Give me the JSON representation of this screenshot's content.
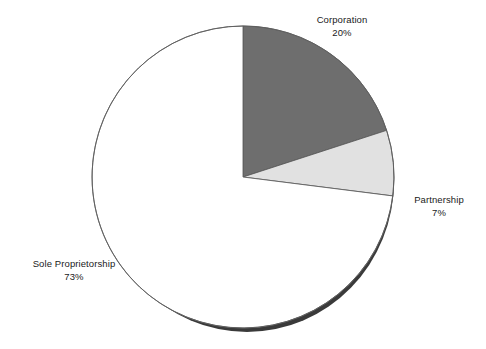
{
  "chart_data": {
    "type": "pie",
    "title": "",
    "subtitle": "",
    "xlabel": "",
    "ylabel": "",
    "legend_position": "outside-labels",
    "grid": false,
    "start_angle_deg": 0,
    "direction": "clockwise",
    "categories": [
      "Corporation",
      "Partnership",
      "Sole Proprietorship"
    ],
    "values": [
      20,
      7,
      73
    ],
    "value_unit": "%",
    "slices": [
      {
        "name": "Corporation",
        "value": 20,
        "value_label": "20%",
        "color": "#6e6e6e",
        "start_deg": 0,
        "end_deg": 72
      },
      {
        "name": "Partnership",
        "value": 7,
        "value_label": "7%",
        "color": "#e1e1e1",
        "start_deg": 72,
        "end_deg": 97.2
      },
      {
        "name": "Sole Proprietorship",
        "value": 73,
        "value_label": "73%",
        "color": "#ffffff",
        "start_deg": 97.2,
        "end_deg": 360
      }
    ]
  },
  "labels": {
    "corporation": {
      "name": "Corporation",
      "value": "20%"
    },
    "partnership": {
      "name": "Partnership",
      "value": "7%"
    },
    "sole_proprietorship": {
      "name": "Sole Proprietorship",
      "value": "73%"
    }
  },
  "style": {
    "background": "#ffffff",
    "outline_color": "#555555",
    "shadow_color": "#3a3a3a",
    "text_color": "#1a1a1a"
  }
}
